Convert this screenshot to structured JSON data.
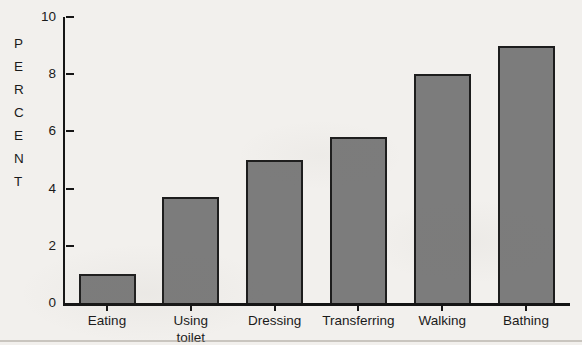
{
  "chart_data": {
    "type": "bar",
    "title": "",
    "ylabel": "PERCENT",
    "xlabel": "",
    "categories": [
      "Eating",
      "Using toilet",
      "Dressing",
      "Transferring",
      "Walking",
      "Bathing"
    ],
    "values": [
      1,
      3.7,
      5,
      5.8,
      8,
      9
    ],
    "ylim": [
      0,
      10
    ],
    "yticks": [
      0,
      2,
      4,
      6,
      8,
      10
    ],
    "grid": false,
    "legend": false,
    "bar_color": "#7c7c7c",
    "bar_border_color": "#1d1d1d",
    "axis_color": "#161616",
    "background_color": "#f2f0ed",
    "text_color": "#1a1a1a"
  }
}
